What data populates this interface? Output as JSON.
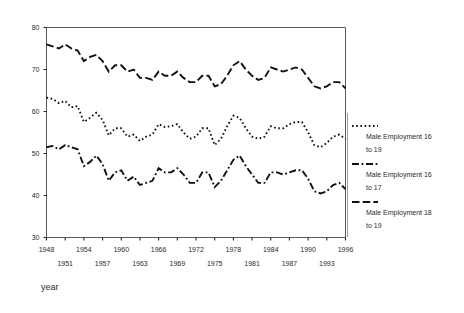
{
  "chart_data": {
    "type": "line",
    "title": "",
    "xlabel": "year",
    "ylabel": "",
    "xlim": [
      1948,
      1996
    ],
    "ylim": [
      30,
      80
    ],
    "grid": false,
    "legend_position": "right",
    "x": [
      1948,
      1949,
      1950,
      1951,
      1952,
      1953,
      1954,
      1955,
      1956,
      1957,
      1958,
      1959,
      1960,
      1961,
      1962,
      1963,
      1964,
      1965,
      1966,
      1967,
      1968,
      1969,
      1970,
      1971,
      1972,
      1973,
      1974,
      1975,
      1976,
      1977,
      1978,
      1979,
      1980,
      1981,
      1982,
      1983,
      1984,
      1985,
      1986,
      1987,
      1988,
      1989,
      1990,
      1991,
      1992,
      1993,
      1994,
      1995,
      1996
    ],
    "xticks_major": [
      "1948",
      "1954",
      "1960",
      "1966",
      "1972",
      "1978",
      "1984",
      "1990",
      "1996"
    ],
    "xticks_minor": [
      "1951",
      "1957",
      "1963",
      "1969",
      "1975",
      "1981",
      "1987",
      "1993"
    ],
    "yticks": [
      "30",
      "40",
      "50",
      "60",
      "70",
      "80"
    ],
    "series": [
      {
        "name": "Male Employment 16 to 19",
        "style": "dotted",
        "values": [
          63.3,
          63.0,
          62.0,
          62.5,
          61.0,
          61.3,
          57.5,
          58.5,
          59.7,
          58.0,
          54.3,
          56.0,
          56.0,
          54.0,
          54.5,
          53.0,
          54.0,
          54.5,
          57.0,
          56.3,
          56.5,
          57.0,
          55.0,
          53.5,
          54.0,
          56.0,
          56.0,
          52.0,
          53.5,
          56.5,
          59.0,
          58.5,
          56.0,
          54.0,
          53.5,
          54.0,
          56.5,
          56.0,
          56.0,
          57.0,
          57.5,
          57.5,
          55.0,
          52.0,
          51.5,
          52.5,
          54.0,
          54.5,
          53.5
        ]
      },
      {
        "name": "Male Employment 16 to 17",
        "style": "dashdot",
        "values": [
          51.5,
          51.8,
          51.0,
          52.0,
          51.5,
          51.0,
          47.0,
          48.0,
          49.5,
          47.5,
          43.5,
          45.5,
          46.0,
          43.5,
          44.5,
          42.5,
          43.0,
          43.5,
          46.5,
          45.5,
          45.5,
          46.5,
          45.0,
          43.0,
          43.0,
          45.5,
          45.5,
          42.0,
          43.5,
          46.0,
          48.5,
          49.5,
          47.0,
          45.0,
          43.0,
          43.0,
          45.5,
          45.5,
          45.0,
          45.5,
          46.0,
          46.0,
          44.0,
          41.0,
          40.5,
          41.0,
          42.5,
          43.0,
          41.5
        ]
      },
      {
        "name": "Male Employment 18 to 19",
        "style": "dashed",
        "values": [
          76.0,
          75.5,
          75.0,
          76.0,
          75.0,
          74.5,
          72.0,
          73.0,
          73.5,
          72.0,
          69.5,
          71.0,
          71.0,
          69.5,
          70.0,
          68.0,
          68.0,
          67.5,
          69.5,
          68.5,
          68.5,
          69.5,
          68.0,
          67.0,
          67.0,
          68.5,
          68.5,
          66.0,
          66.5,
          68.5,
          71.0,
          72.0,
          70.0,
          68.5,
          67.5,
          68.0,
          70.5,
          70.0,
          69.5,
          70.0,
          70.5,
          70.0,
          68.0,
          66.0,
          65.5,
          66.0,
          67.0,
          67.0,
          65.5
        ]
      }
    ]
  },
  "legend": {
    "entries": [
      {
        "label_line1": "Male Employment 16",
        "label_line2": "to 19",
        "style": "dotted"
      },
      {
        "label_line1": "Male Employment 16",
        "label_line2": "to 17",
        "style": "dashdot"
      },
      {
        "label_line1": "Male Employment 18",
        "label_line2": "to 19",
        "style": "dashed"
      }
    ]
  },
  "colors": {
    "line": "#111111",
    "axis": "#5a5a5a",
    "text": "#2b2b2b",
    "background": "#ffffff"
  }
}
